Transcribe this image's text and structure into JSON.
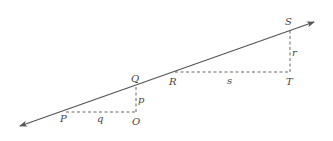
{
  "diagram": {
    "line": {
      "start": [
        20,
        126
      ],
      "end": [
        314,
        22
      ],
      "arrows": "both",
      "color": "#555555"
    },
    "points": {
      "P": {
        "label": "P",
        "x": 66,
        "y": 112
      },
      "O": {
        "label": "O",
        "x": 136,
        "y": 112
      },
      "Q": {
        "label": "Q",
        "x": 136,
        "y": 86
      },
      "R": {
        "label": "R",
        "x": 175,
        "y": 72
      },
      "T": {
        "label": "T",
        "x": 290,
        "y": 72
      },
      "S": {
        "label": "S",
        "x": 290,
        "y": 29
      }
    },
    "segments": {
      "q": {
        "label": "q",
        "from": "P",
        "to": "O",
        "style": "dashed"
      },
      "p": {
        "label": "p",
        "from": "O",
        "to": "Q",
        "style": "dashed"
      },
      "s": {
        "label": "s",
        "from": "R",
        "to": "T",
        "style": "dashed"
      },
      "r": {
        "label": "r",
        "from": "T",
        "to": "S",
        "style": "dashed"
      }
    }
  }
}
